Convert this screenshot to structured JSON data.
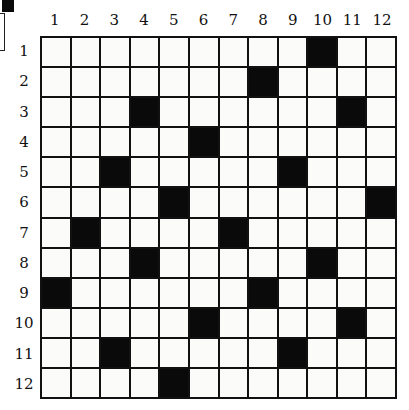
{
  "puzzle": {
    "rows": 12,
    "cols": 12,
    "column_labels": [
      "1",
      "2",
      "3",
      "4",
      "5",
      "6",
      "7",
      "8",
      "9",
      "10",
      "11",
      "12"
    ],
    "row_labels": [
      "1",
      "2",
      "3",
      "4",
      "5",
      "6",
      "7",
      "8",
      "9",
      "10",
      "11",
      "12"
    ],
    "black_cells": [
      [
        1,
        10
      ],
      [
        2,
        8
      ],
      [
        3,
        4
      ],
      [
        3,
        11
      ],
      [
        4,
        6
      ],
      [
        5,
        3
      ],
      [
        5,
        9
      ],
      [
        6,
        5
      ],
      [
        6,
        12
      ],
      [
        7,
        2
      ],
      [
        7,
        7
      ],
      [
        8,
        4
      ],
      [
        8,
        10
      ],
      [
        9,
        1
      ],
      [
        9,
        8
      ],
      [
        10,
        6
      ],
      [
        10,
        11
      ],
      [
        11,
        3
      ],
      [
        11,
        9
      ],
      [
        12,
        5
      ]
    ],
    "colors": {
      "black_cell": "#0a0a0a",
      "white_cell": "#fbfbfa",
      "grid_line": "#111111"
    }
  }
}
